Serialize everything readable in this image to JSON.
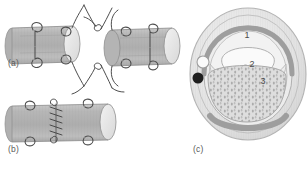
{
  "figure": {
    "panels": [
      {
        "id": "a",
        "label": "(a)",
        "caption_x": 8,
        "caption_y": 64,
        "description": "two divided tube ends held apart by stay sutures"
      },
      {
        "id": "b",
        "label": "(b)",
        "caption_x": 8,
        "caption_y": 150,
        "description": "completed end-to-end anastomosis with interrupted sutures"
      },
      {
        "id": "c",
        "label": "(c)",
        "caption_x": 193,
        "caption_y": 150,
        "description": "cross-section of anastomosed structure with numbered layers"
      }
    ],
    "callouts": [
      {
        "number": "1",
        "x": 247,
        "y": 33
      },
      {
        "number": "2",
        "x": 252,
        "y": 65
      },
      {
        "number": "3",
        "x": 262,
        "y": 82
      }
    ]
  },
  "colors": {
    "tube_fill": "#b8b8b8",
    "tube_fill_light": "#cfcfcf",
    "tube_lumen": "#e6e6e6",
    "tube_edge": "#8f8f8f",
    "suture": "#4d4d4d",
    "outer_ring": "#e3e3e3",
    "ring_band": "#9e9e9e",
    "inner_fill": "#efefef",
    "stipple_fill": "#dcdcdc",
    "stipple_dot": "#9a9a9a",
    "dark_dot": "#1f1f1f",
    "label_text": "#5a5a5a"
  }
}
